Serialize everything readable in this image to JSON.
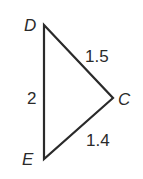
{
  "figure": {
    "type": "triangle",
    "vertices": [
      {
        "name": "D",
        "x": 44,
        "y": 25
      },
      {
        "name": "C",
        "x": 113,
        "y": 98
      },
      {
        "name": "E",
        "x": 44,
        "y": 159
      }
    ],
    "sides": [
      {
        "from": "D",
        "to": "C",
        "length": "1.5"
      },
      {
        "from": "D",
        "to": "E",
        "length": "2"
      },
      {
        "from": "E",
        "to": "C",
        "length": "1.4"
      }
    ],
    "labels": {
      "D": "D",
      "C": "C",
      "E": "E",
      "DC": "1.5",
      "DE": "2",
      "EC": "1.4"
    },
    "stroke_color": "#2a2a2a"
  }
}
